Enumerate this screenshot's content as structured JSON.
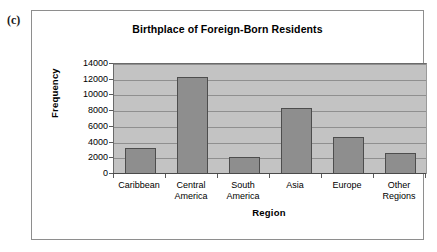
{
  "figure": {
    "panel_label": "(c)"
  },
  "chart_data": {
    "type": "bar",
    "title": "Birthplace of Foreign-Born Residents",
    "xlabel": "Region",
    "ylabel": "Frequency",
    "categories": [
      "Caribbean",
      "Central America",
      "South America",
      "Asia",
      "Europe",
      "Other Regions"
    ],
    "values": [
      3350,
      12400,
      2150,
      8400,
      4650,
      2700
    ],
    "ylim": [
      0,
      14000
    ],
    "ytick_labels": [
      "14000",
      "12000",
      "10000",
      "8000",
      "6000",
      "4000",
      "2000",
      "0"
    ],
    "ytick_values": [
      14000,
      12000,
      10000,
      8000,
      6000,
      4000,
      2000,
      0
    ],
    "grid": true,
    "legend": false,
    "colors": {
      "bar_fill": "#8e8e8e",
      "bar_border": "#4d4d4d",
      "plot_background": "#c3c3c3",
      "gridline": "#8f8f8f",
      "axis": "#4a4a4a",
      "text": "#000000",
      "frame_border": "#8e8e8e"
    }
  }
}
